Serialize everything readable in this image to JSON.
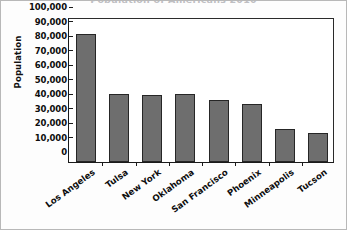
{
  "chart_data": {
    "type": "bar",
    "title": "Population of Americans 2010",
    "xlabel": "",
    "ylabel": "Population",
    "categories": [
      "Los Angeles",
      "Tulsa",
      "New York",
      "Oklahoma",
      "San Francisco",
      "Phoenix",
      "Minneapolis",
      "Tucson"
    ],
    "values": [
      88000,
      47000,
      46000,
      47000,
      43000,
      40000,
      23000,
      20000
    ],
    "ylim": [
      0,
      100000
    ],
    "ytick_values": [
      0,
      10000,
      20000,
      30000,
      40000,
      50000,
      60000,
      70000,
      80000,
      90000,
      100000
    ],
    "ytick_labels": [
      "0",
      "10,000",
      "20,000",
      "30,000",
      "40,000",
      "50,000",
      "60,000",
      "70,000",
      "80,000",
      "90,000",
      "100,000"
    ],
    "grid": false,
    "legend": false,
    "bar_color": "#6e6e6e",
    "bar_edge_color": "#262626",
    "axis_color": "#1a1a1a",
    "background_color": "#ffffff"
  }
}
